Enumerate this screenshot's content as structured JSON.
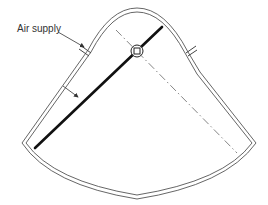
{
  "diagram": {
    "type": "technical-line-drawing",
    "labels": {
      "air_supply": "Air supply"
    },
    "colors": {
      "outline": "#555555",
      "blade": "#111111",
      "centerline": "#666666",
      "text": "#333333",
      "background": "#ffffff"
    },
    "components": [
      {
        "name": "sector-housing",
        "description": "double-walled fan-shaped chamber"
      },
      {
        "name": "air-supply-port-left",
        "description": "inlet stub on upper-left wall"
      },
      {
        "name": "air-supply-port-right",
        "description": "stub on upper-right wall"
      },
      {
        "name": "damper-blade",
        "description": "thick blade pivoting about centre"
      },
      {
        "name": "pivot",
        "description": "circular pivot with square shaft"
      },
      {
        "name": "centerline",
        "description": "dash-dot alternate blade position"
      },
      {
        "name": "blade-indicator-arrow",
        "description": "arrow pointing at blade"
      }
    ]
  }
}
